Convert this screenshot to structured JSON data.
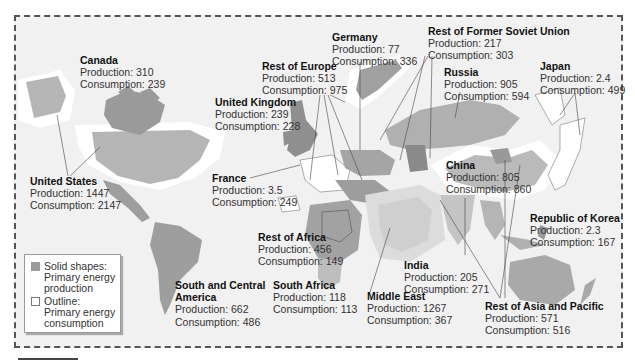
{
  "map": {
    "colors": {
      "background": "#f1f1f1",
      "production_fill": "#9b9b9b",
      "production_fill_light": "#b9b9b9",
      "consumption_outline": "#ffffff",
      "frame_border": "#555555"
    }
  },
  "legend": {
    "solid": {
      "line1": "Solid shapes:",
      "line2": "Primary energy",
      "line3": "production"
    },
    "outline": {
      "line1": "Outline:",
      "line2": "Primary energy",
      "line3": "consumption"
    }
  },
  "regions": [
    {
      "id": "canada",
      "name": "Canada",
      "production": "Production: 310",
      "consumption": "Consumption: 239"
    },
    {
      "id": "united-states",
      "name": "United States",
      "production": "Production: 1447",
      "consumption": "Consumption: 2147"
    },
    {
      "id": "united-kingdom",
      "name": "United Kingdom",
      "production": "Production: 239",
      "consumption": "Consumption: 228"
    },
    {
      "id": "rest-of-europe",
      "name": "Rest of Europe",
      "production": "Production: 513",
      "consumption": "Consumption: 975"
    },
    {
      "id": "germany",
      "name": "Germany",
      "production": "Production: 77",
      "consumption": "Consumption: 336"
    },
    {
      "id": "rest-of-fsu",
      "name": "Rest of Former Soviet Union",
      "production": "Production: 217",
      "consumption": "Consumption: 303"
    },
    {
      "id": "russia",
      "name": "Russia",
      "production": "Production: 905",
      "consumption": "Consumption: 594"
    },
    {
      "id": "japan",
      "name": "Japan",
      "production": "Production: 2.4",
      "consumption": "Consumption: 499"
    },
    {
      "id": "france",
      "name": "France",
      "production": "Production: 3.5",
      "consumption": "Consumption: 249"
    },
    {
      "id": "china",
      "name": "China",
      "production": "Production: 805",
      "consumption": "Consumption: 860"
    },
    {
      "id": "republic-of-korea",
      "name": "Republic of Korea",
      "production": "Production: 2.3",
      "consumption": "Consumption: 167"
    },
    {
      "id": "rest-of-africa",
      "name": "Rest of Africa",
      "production": "Production: 456",
      "consumption": "Consumption: 149"
    },
    {
      "id": "india",
      "name": "India",
      "production": "Production: 205",
      "consumption": "Consumption: 271"
    },
    {
      "id": "south-and-central-america",
      "name": "South and Central",
      "name2": "America",
      "production": "Production: 662",
      "consumption": "Consumption: 486"
    },
    {
      "id": "south-africa",
      "name": "South Africa",
      "production": "Production: 118",
      "consumption": "Consumption: 113"
    },
    {
      "id": "middle-east",
      "name": "Middle East",
      "production": "Production: 1267",
      "consumption": "Consumption: 367"
    },
    {
      "id": "rest-of-asia-pacific",
      "name": "Rest of Asia and Pacific",
      "production": "Production: 571",
      "consumption": "Consumption: 516"
    }
  ]
}
